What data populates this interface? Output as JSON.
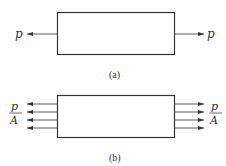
{
  "figure_a": {
    "caption": "(a)",
    "left_label": "p",
    "right_label": "p",
    "description": "Bar with concentrated axial tensile force p at each end"
  },
  "figure_b": {
    "caption": "(b)",
    "left_label": {
      "numerator": "p",
      "denominator": "A"
    },
    "right_label": {
      "numerator": "p",
      "denominator": "A"
    },
    "arrow_count_per_side": 4,
    "description": "Bar with uniformly distributed stress p/A across each end"
  },
  "colors": {
    "stroke": "#333333",
    "background": "#ffffff"
  }
}
